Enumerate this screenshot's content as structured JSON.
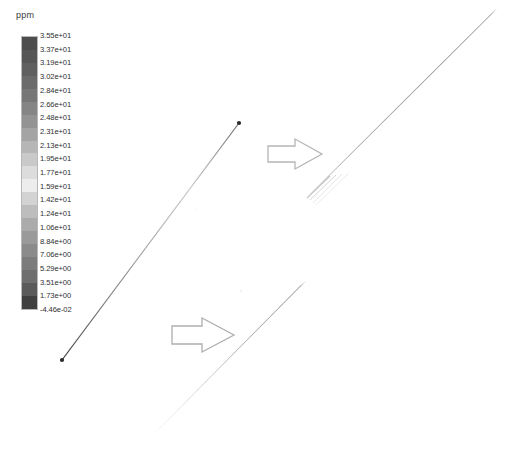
{
  "figure": {
    "background_color": "#ffffff",
    "kind": "cfd-contour-plume"
  },
  "legend": {
    "title": "ppm",
    "units": "ppm",
    "orientation": "vertical",
    "border_color": "#b8b8b8",
    "tick_labels": [
      "3.55e+01",
      "3.37e+01",
      "3.19e+01",
      "3.02e+01",
      "2.84e+01",
      "2.66e+01",
      "2.48e+01",
      "2.31e+01",
      "2.13e+01",
      "1.95e+01",
      "1.77e+01",
      "1.59e+01",
      "1.42e+01",
      "1.24e+01",
      "1.06e+01",
      "8.84e+00",
      "7.06e+00",
      "5.29e+00",
      "3.51e+00",
      "1.73e+00",
      "-4.46e-02"
    ],
    "band_colors": [
      "#4d4d4d",
      "#565656",
      "#606060",
      "#6b6b6b",
      "#777777",
      "#858585",
      "#939393",
      "#a4a4a4",
      "#b6b6b6",
      "#c9c9c9",
      "#dcdcdc",
      "#ededed",
      "#d3d3d3",
      "#bdbdbd",
      "#ababab",
      "#9a9a9a",
      "#8b8b8b",
      "#7c7c7c",
      "#6e6e6e",
      "#5a5a5a",
      "#3f3f3f"
    ]
  },
  "chart_data": {
    "type": "heatmap",
    "title": "",
    "xlabel": "",
    "ylabel": "",
    "colorbar_label": "ppm",
    "colorbar_range": [
      -0.0446,
      35.5
    ],
    "colorbar_ticks": [
      35.5,
      33.7,
      31.9,
      30.2,
      28.4,
      26.6,
      24.8,
      23.1,
      21.3,
      19.5,
      17.7,
      15.9,
      14.2,
      12.4,
      10.6,
      8.84,
      7.06,
      5.29,
      3.51,
      1.73,
      -0.0446
    ],
    "grid": false,
    "legend_position": "left",
    "features": [
      {
        "name": "source-plume-line",
        "description": "Thin diagonal concentration plume from source point to receptor point",
        "start_point": [
          62,
          360
        ],
        "end_point": [
          239,
          123
        ],
        "endpoint_markers": true
      },
      {
        "name": "plume-detail-upper",
        "description": "Magnified strip view of upper plume segment",
        "start_point": [
          310,
          196
        ],
        "end_point": [
          494,
          10
        ]
      },
      {
        "name": "plume-detail-lower",
        "description": "Magnified strip view of lower plume segment",
        "start_point": [
          155,
          432
        ],
        "end_point": [
          303,
          283
        ]
      }
    ]
  },
  "annotations": {
    "arrows": [
      {
        "name": "callout-arrow-upper",
        "label": "",
        "direction": "right",
        "x": 268,
        "y": 138,
        "width": 56,
        "height": 32,
        "stroke_color": "#b0b0b0"
      },
      {
        "name": "callout-arrow-lower",
        "label": "",
        "direction": "right",
        "x": 172,
        "y": 318,
        "width": 62,
        "height": 34,
        "stroke_color": "#aaaaaa"
      }
    ]
  }
}
